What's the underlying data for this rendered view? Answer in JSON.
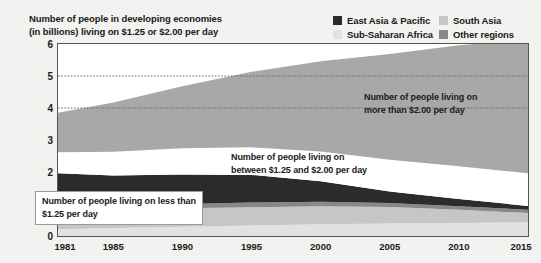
{
  "chart_title": "Number of people in developing economies\n(in billions) living on $1.25 or $2.00 per day",
  "legend": {
    "items": [
      {
        "label": "East Asia & Pacific",
        "color": "#2b2b2b",
        "swatch_icon": "legend-swatch-icon"
      },
      {
        "label": "South Asia",
        "color": "#c6c6c6",
        "swatch_icon": "legend-swatch-icon"
      },
      {
        "label": "Sub-Saharan Africa",
        "color": "#e2e2e2",
        "swatch_icon": "legend-swatch-icon"
      },
      {
        "label": "Other regions",
        "color": "#888888",
        "swatch_icon": "legend-swatch-icon"
      }
    ]
  },
  "callouts": {
    "low": "Number of people living on less than\n$1.25 per day",
    "mid": "Number of people living on\nbetween $1.25 and $2.00 per day",
    "high": "Number of people living on\nmore than $2.00 per day"
  },
  "chart_data": {
    "type": "area",
    "title": "Number of people in developing economies (in billions) living on $1.25 or $2.00 per day",
    "xlabel": "",
    "ylabel": "",
    "xlim": [
      1981,
      2015
    ],
    "ylim": [
      0,
      6
    ],
    "grid": "dotted horizontal gridlines at 4 and 5",
    "legend_position": "top-right",
    "yticks": [
      "0",
      "1",
      "2",
      "3",
      "4",
      "5",
      "6"
    ],
    "xticks": [
      "1981",
      "1985",
      "1990",
      "1995",
      "2000",
      "2005",
      "2010",
      "2015"
    ],
    "x": [
      1981,
      1985,
      1990,
      1995,
      2000,
      2005,
      2010,
      2015
    ],
    "stack_order_bottom_to_top": [
      "Under $1.25 - Sub-Saharan Africa",
      "Under $1.25 - South Asia",
      "Under $1.25 - Other regions",
      "Under $1.25 - East Asia & Pacific",
      "Between $1.25 and $2.00",
      "More than $2.00"
    ],
    "series": [
      {
        "name": "Under $1.25 - Sub-Saharan Africa",
        "color": "#e2e2e2",
        "values": [
          0.21,
          0.25,
          0.29,
          0.33,
          0.37,
          0.39,
          0.41,
          0.43
        ]
      },
      {
        "name": "Under $1.25 - South Asia",
        "color": "#c6c6c6",
        "values": [
          0.55,
          0.56,
          0.58,
          0.57,
          0.56,
          0.52,
          0.41,
          0.29
        ]
      },
      {
        "name": "Under $1.25 - Other regions",
        "color": "#888888",
        "values": [
          0.12,
          0.12,
          0.13,
          0.15,
          0.14,
          0.12,
          0.11,
          0.1
        ]
      },
      {
        "name": "Under $1.25 - East Asia & Pacific",
        "color": "#2b2b2b",
        "values": [
          1.08,
          0.96,
          0.92,
          0.86,
          0.64,
          0.36,
          0.23,
          0.12
        ]
      },
      {
        "name": "Between $1.25 and $2.00",
        "color": "#ffffff",
        "values": [
          0.66,
          0.74,
          0.82,
          0.86,
          0.93,
          0.99,
          1.02,
          1.02
        ]
      },
      {
        "name": "More than $2.00",
        "color": "#a8a8a8",
        "values": [
          1.23,
          1.54,
          1.94,
          2.36,
          2.82,
          3.31,
          3.78,
          4.18
        ]
      }
    ],
    "totals": [
      3.85,
      4.17,
      4.68,
      5.13,
      5.46,
      5.69,
      5.96,
      6.14
    ]
  }
}
